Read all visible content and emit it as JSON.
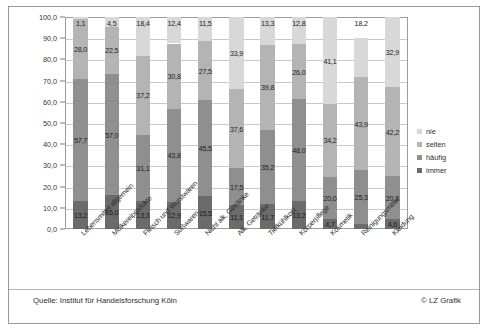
{
  "chart_data": {
    "type": "bar",
    "subtype": "stacked-bar-100",
    "title": "",
    "xlabel": "",
    "ylabel": "",
    "ylim": [
      0,
      100
    ],
    "ytick_labels": [
      "0,0",
      "10,0",
      "20,0",
      "30,0",
      "40,0",
      "50,0",
      "60,0",
      "70,0",
      "80,0",
      "90,0",
      "100,0"
    ],
    "ytick_values": [
      0,
      10,
      20,
      30,
      40,
      50,
      60,
      70,
      80,
      90,
      100
    ],
    "grid": true,
    "legend_position": "right",
    "categories": [
      "Lebensmittel allgemein",
      "Molkereiprodukte",
      "Fleisch und Wurstwaren",
      "Süßwaren",
      "Nicht alk. Getränke",
      "Alk. Getränke",
      "Tiefkühlkost",
      "Körperpflege",
      "Kosmetik",
      "Reinigungsmittel",
      "Kleidung"
    ],
    "series": [
      {
        "name": "immer",
        "color": "#6b6b6b",
        "values": [
          13.2,
          16.0,
          13.3,
          12.9,
          15.5,
          11.1,
          11.7,
          13.2,
          4.7,
          2.5,
          4.6
        ],
        "labels": [
          "13,2",
          "16,0",
          "13,3",
          "12,9",
          "15,5",
          "11,1",
          "11,7",
          "13,2",
          "4,7",
          "",
          "4,6"
        ]
      },
      {
        "name": "häufig",
        "color": "#8f8f8f",
        "values": [
          57.7,
          57.0,
          31.1,
          43.8,
          45.5,
          17.5,
          35.2,
          48.0,
          20.0,
          25.3,
          20.2
        ],
        "labels": [
          "57,7",
          "57,0",
          "31,1",
          "43,8",
          "45,5",
          "17,5",
          "35,2",
          "48,0",
          "20,0",
          "25,3",
          "20,2"
        ]
      },
      {
        "name": "selten",
        "color": "#b4b4b4",
        "values": [
          28.0,
          22.5,
          37.2,
          30.8,
          27.5,
          37.6,
          39.8,
          26.0,
          34.2,
          43.9,
          42.2
        ],
        "labels": [
          "28,0",
          "22,5",
          "37,2",
          "30,8",
          "27,5",
          "37,6",
          "39,8",
          "26,0",
          "34,2",
          "43,9",
          "42,2"
        ]
      },
      {
        "name": "nie",
        "color": "#d8d8d8",
        "values": [
          1.1,
          4.5,
          18.4,
          12.4,
          11.5,
          33.9,
          13.3,
          12.8,
          41.1,
          18.2,
          32.9
        ],
        "labels": [
          "1,1",
          "4,5",
          "18,4",
          "12,4",
          "11,5",
          "33,9",
          "13,3",
          "12,8",
          "41,1",
          "18,2",
          "32,9"
        ]
      }
    ]
  },
  "legend": {
    "items": [
      {
        "label": "nie",
        "color": "#d8d8d8"
      },
      {
        "label": "selten",
        "color": "#b4b4b4"
      },
      {
        "label": "häufig",
        "color": "#8f8f8f"
      },
      {
        "label": "immer",
        "color": "#6b6b6b"
      }
    ]
  },
  "footer": {
    "source": "Quelle: Institut für Handelsforschung Köln",
    "credit": "© LZ Grafik"
  }
}
